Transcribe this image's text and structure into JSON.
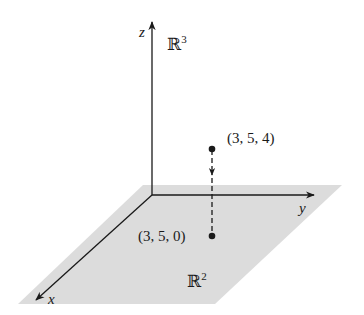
{
  "diagram": {
    "axes": {
      "x_label": "x",
      "y_label": "y",
      "z_label": "z"
    },
    "spaces": {
      "r3": {
        "base": "ℝ",
        "exponent": "3"
      },
      "r2": {
        "base": "ℝ",
        "exponent": "2"
      }
    },
    "points": [
      {
        "name": "point-3d",
        "label": "(3, 5, 4)"
      },
      {
        "name": "point-projected",
        "label": "(3, 5, 0)"
      }
    ],
    "colors": {
      "plane_fill": "#dcdcdc",
      "line": "#1a1a1a"
    }
  }
}
